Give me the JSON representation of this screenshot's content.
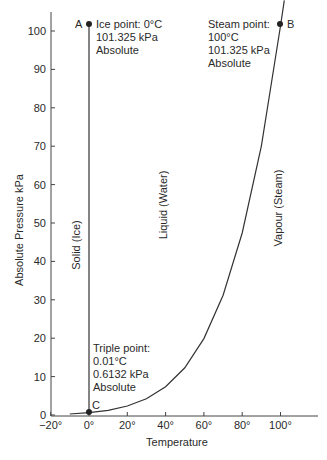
{
  "chart_data": {
    "type": "line",
    "title": "",
    "xlabel": "Temperature",
    "ylabel": "Absolute Pressure kPa",
    "xlim": [
      -20,
      120
    ],
    "ylim": [
      0,
      105
    ],
    "x_ticks": [
      "−20°",
      "0°",
      "20°",
      "40°",
      "60°",
      "80°",
      "100°"
    ],
    "y_ticks": [
      "0",
      "10",
      "20",
      "30",
      "40",
      "50",
      "60",
      "70",
      "80",
      "90",
      "100"
    ],
    "grid": false,
    "series": [
      {
        "name": "Vapour pressure curve (liquid/vapour boundary)",
        "x": [
          -10,
          0,
          10,
          20,
          30,
          40,
          50,
          60,
          70,
          80,
          90,
          100,
          102
        ],
        "y": [
          0.26,
          0.61,
          1.23,
          2.34,
          4.25,
          7.38,
          12.3,
          19.9,
          31.2,
          47.4,
          70.1,
          101.3,
          108
        ]
      },
      {
        "name": "Melting line (solid/liquid boundary)",
        "x": [
          0,
          0
        ],
        "y": [
          0.61,
          101.325
        ]
      }
    ],
    "points": [
      {
        "id": "A",
        "x": 0,
        "y": 101.325,
        "label": [
          "Ice point: 0°C",
          "101.325 kPa",
          "Absolute"
        ]
      },
      {
        "id": "B",
        "x": 100,
        "y": 101.325,
        "label": [
          "Steam point:",
          "100°C",
          "101.325 kPa",
          "Absolute"
        ]
      },
      {
        "id": "C",
        "x": 0.01,
        "y": 0.6132,
        "label": [
          "Triple point:",
          "0.01°C",
          "0.6132 kPa",
          "Absolute"
        ]
      }
    ],
    "region_labels": [
      "Solid (Ice)",
      "Liquid (Water)",
      "Vapour (Steam)"
    ]
  },
  "labels": {
    "point_a": "A",
    "point_b": "B",
    "point_c": "C",
    "ice": [
      "Ice point: 0°C",
      "101.325 kPa",
      "Absolute"
    ],
    "steam": [
      "Steam point:",
      "100°C",
      "101.325 kPa",
      "Absolute"
    ],
    "triple": [
      "Triple point:",
      "0.01°C",
      "0.6132 kPa",
      "Absolute"
    ],
    "solid": "Solid (Ice)",
    "liquid": "Liquid (Water)",
    "vapour": "Vapour (Steam)",
    "xlabel": "Temperature",
    "ylabel": "Absolute Pressure kPa"
  }
}
